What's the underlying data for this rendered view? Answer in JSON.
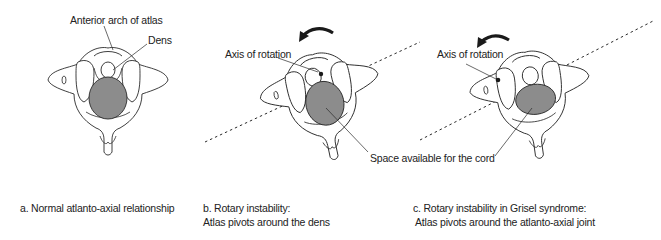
{
  "diagram": {
    "colors": {
      "line": "#2a2a2a",
      "cord_fill": "#8c8c8c",
      "background": "#ffffff"
    },
    "panels": [
      {
        "id": "a",
        "labels": {
          "anterior_arch": "Anterior arch of atlas",
          "dens": "Dens"
        },
        "caption": [
          "a. Normal atlanto-axial relationship"
        ]
      },
      {
        "id": "b",
        "labels": {
          "axis": "Axis of rotation",
          "space": "Space available for the cord"
        },
        "rotation_arrow": "counterclockwise-arrow",
        "caption": [
          "b. Rotary instability:",
          "Atlas pivots around the dens"
        ]
      },
      {
        "id": "c",
        "labels": {
          "axis": "Axis of rotation"
        },
        "rotation_arrow": "counterclockwise-arrow",
        "caption": [
          "c. Rotary instability in Grisel syndrome:",
          "Atlas pivots around the atlanto-axial joint"
        ]
      }
    ]
  }
}
